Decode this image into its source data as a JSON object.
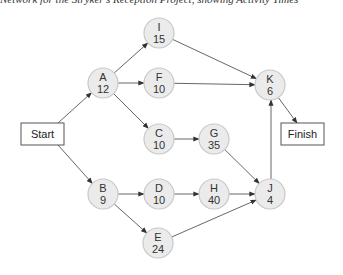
{
  "caption": "Network for the Stryker's Reception Project, showing Activity Times",
  "start": {
    "label": "Start",
    "x": 21,
    "y": 123,
    "w": 43,
    "h": 22
  },
  "finish": {
    "label": "Finish",
    "x": 281,
    "y": 123,
    "w": 43,
    "h": 22
  },
  "nodes": [
    {
      "id": "A",
      "time": "12",
      "cx": 103,
      "cy": 83
    },
    {
      "id": "I",
      "time": "15",
      "cx": 159,
      "cy": 33
    },
    {
      "id": "F",
      "time": "10",
      "cx": 159,
      "cy": 83
    },
    {
      "id": "C",
      "time": "10",
      "cx": 159,
      "cy": 139
    },
    {
      "id": "G",
      "time": "35",
      "cx": 214,
      "cy": 139
    },
    {
      "id": "K",
      "time": "6",
      "cx": 270,
      "cy": 85
    },
    {
      "id": "B",
      "time": "9",
      "cx": 103,
      "cy": 194
    },
    {
      "id": "D",
      "time": "10",
      "cx": 159,
      "cy": 194
    },
    {
      "id": "H",
      "time": "40",
      "cx": 214,
      "cy": 194
    },
    {
      "id": "J",
      "time": "4",
      "cx": 270,
      "cy": 194
    },
    {
      "id": "E",
      "time": "24",
      "cx": 158,
      "cy": 243
    }
  ],
  "edges": [
    {
      "from": "Start",
      "to": "A"
    },
    {
      "from": "Start",
      "to": "B"
    },
    {
      "from": "A",
      "to": "I"
    },
    {
      "from": "A",
      "to": "F"
    },
    {
      "from": "A",
      "to": "C"
    },
    {
      "from": "I",
      "to": "K"
    },
    {
      "from": "F",
      "to": "K"
    },
    {
      "from": "C",
      "to": "G"
    },
    {
      "from": "G",
      "to": "J"
    },
    {
      "from": "B",
      "to": "D"
    },
    {
      "from": "B",
      "to": "E"
    },
    {
      "from": "D",
      "to": "H"
    },
    {
      "from": "H",
      "to": "J"
    },
    {
      "from": "E",
      "to": "J"
    },
    {
      "from": "J",
      "to": "K"
    },
    {
      "from": "K",
      "to": "Finish"
    }
  ],
  "colors": {
    "node_fill": "#ebebeb",
    "node_stroke": "#c8c8c8",
    "edge": "#555555",
    "box_stroke": "#555555"
  }
}
